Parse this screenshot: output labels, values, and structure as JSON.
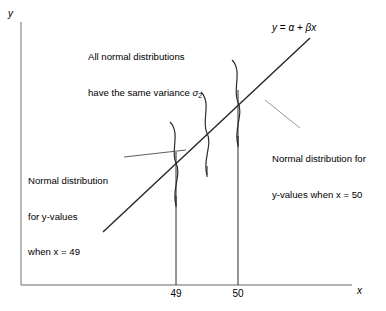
{
  "figure": {
    "type": "statistical-diagram"
  },
  "axes": {
    "y_label": "y",
    "x_label": "x",
    "line_color": "#888888",
    "origin": {
      "x": 21,
      "y": 285
    },
    "x_axis_end": {
      "x": 352,
      "y": 285
    },
    "y_axis_top": {
      "x": 21,
      "y": 22
    }
  },
  "ticks": [
    {
      "label": "49",
      "x": 176
    },
    {
      "label": "50",
      "x": 238
    }
  ],
  "regression_line": {
    "equation_parts": {
      "y": "y",
      "equals": " = ",
      "alpha": "α",
      "plus": " + ",
      "beta": "β",
      "x": "x"
    },
    "equation_text": "y = α + βx",
    "color": "#1a1a1a",
    "start": {
      "x": 103,
      "y": 232
    },
    "end": {
      "x": 310,
      "y": 38
    }
  },
  "variance_note": {
    "line1": "All normal distributions",
    "line2_prefix": "have the same variance ",
    "line2_symbol": "σ",
    "line2_subscript": "2"
  },
  "annotations": [
    {
      "name": "left-annotation",
      "lines": [
        "Normal distribution",
        "for y-values",
        "when x = 49"
      ],
      "leader": {
        "x1": 124,
        "y1": 157,
        "x2": 186,
        "y2": 150
      }
    },
    {
      "name": "right-annotation",
      "lines": [
        "Normal distribution for",
        "y-values when x = 50"
      ],
      "leader": {
        "x1": 265,
        "y1": 100,
        "x2": 300,
        "y2": 128
      }
    }
  ],
  "curves": [
    {
      "name": "normal-curve-x49",
      "center_x": 176,
      "top": 122,
      "bottom": 205,
      "amplitude": 22,
      "stem_bottom": 205
    },
    {
      "name": "normal-curve-middle",
      "center_x": 207,
      "top": 92,
      "bottom": 175,
      "amplitude": 22,
      "stem_bottom": 175
    },
    {
      "name": "normal-curve-x50",
      "center_x": 238,
      "top": 60,
      "bottom": 145,
      "amplitude": 22,
      "stem_bottom": 145
    }
  ],
  "vertical_lines": [
    {
      "name": "vline-49",
      "x": 176,
      "y_top": 152,
      "y_bottom": 285
    },
    {
      "name": "vline-50",
      "x": 238,
      "y_top": 90,
      "y_bottom": 285
    }
  ]
}
